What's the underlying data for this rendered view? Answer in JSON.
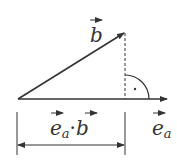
{
  "diagram": {
    "labels": {
      "b": "b",
      "ea": "e",
      "ea_sub": "a",
      "proj_e": "e",
      "proj_sub": "a",
      "proj_dot": "·",
      "proj_b": "b",
      "right_angle_dot": "·"
    },
    "colors": {
      "line": "#333333",
      "background": "#ffffff"
    }
  }
}
